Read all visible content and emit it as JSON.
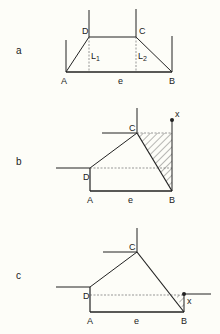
{
  "figure": {
    "panels": [
      {
        "id": "a",
        "label": "a",
        "points": {
          "A": "A",
          "B": "B",
          "C": "C",
          "D": "D"
        },
        "base_label": "e",
        "lengths": {
          "L1_main": "L",
          "L1_sub": "1",
          "L2_main": "L",
          "L2_sub": "2"
        }
      },
      {
        "id": "b",
        "label": "b",
        "points": {
          "A": "A",
          "B": "B",
          "C": "C",
          "D": "D"
        },
        "base_label": "e",
        "marker": "x"
      },
      {
        "id": "c",
        "label": "c",
        "points": {
          "A": "A",
          "B": "B",
          "C": "C",
          "D": "D"
        },
        "base_label": "e",
        "marker": "x"
      }
    ]
  }
}
